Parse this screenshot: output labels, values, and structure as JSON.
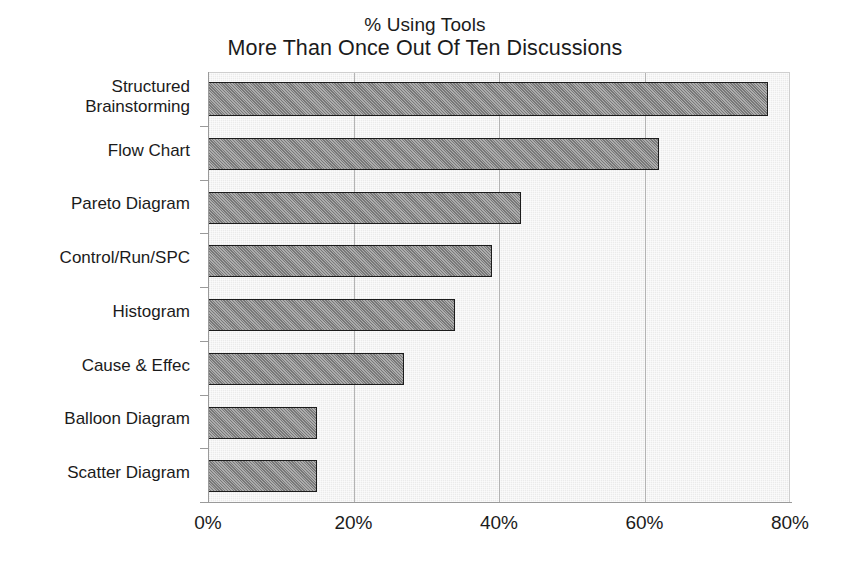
{
  "chart_data": {
    "type": "bar",
    "orientation": "horizontal",
    "title": "% Using Tools\nMore Than Once Out Of Ten Discussions",
    "title_line_1": "% Using Tools",
    "title_line_2": "More Than Once Out Of Ten Discussions",
    "xlabel": "",
    "ylabel": "",
    "categories": [
      "Structured Brainstorming",
      "Flow Chart",
      "Pareto Diagram",
      "Control/Run/SPC",
      "Histogram",
      "Cause & Effec",
      "Balloon Diagram",
      "Scatter Diagram"
    ],
    "category_lines": [
      [
        "Structured",
        "Brainstorming"
      ],
      [
        "Flow Chart"
      ],
      [
        "Pareto Diagram"
      ],
      [
        "Control/Run/SPC"
      ],
      [
        "Histogram"
      ],
      [
        "Cause & Effec"
      ],
      [
        "Balloon Diagram"
      ],
      [
        "Scatter Diagram"
      ]
    ],
    "values": [
      77,
      62,
      43,
      39,
      34,
      27,
      15,
      15
    ],
    "value_labels": [
      "77%",
      "62%",
      "43%",
      "39%",
      "34%",
      "27%",
      "15%",
      "15%"
    ],
    "xlim": [
      0,
      80
    ],
    "xticks": [
      0,
      20,
      40,
      60,
      80
    ],
    "xtick_labels": [
      "0%",
      "20%",
      "40%",
      "60%",
      "80%"
    ],
    "gridlines": [
      20,
      40,
      60
    ],
    "grid": true,
    "legend": null,
    "legend_position": "none",
    "bar_fill_color": "#8c8c8c",
    "bar_border_color": "#1c1c1c",
    "plot_background_color": "#ebebeb",
    "gridline_color": "#b4b4b4",
    "axis_color": "#9a9a9a",
    "text_color": "#1b1b1b",
    "page_background_color": "#ffffff"
  }
}
